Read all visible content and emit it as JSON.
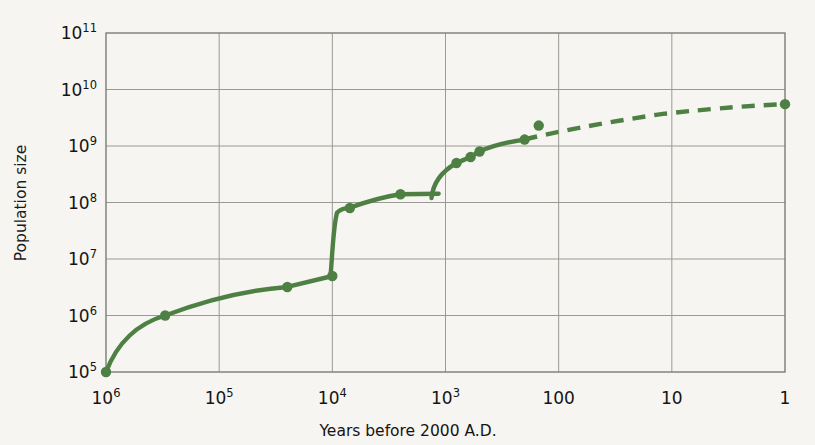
{
  "chart_data": {
    "type": "line",
    "title": "",
    "xlabel": "Years before 2000 A.D.",
    "ylabel": "Population size",
    "x_scale": "log-reversed",
    "y_scale": "log",
    "xlim": [
      1000000,
      1
    ],
    "ylim": [
      100000,
      100000000000
    ],
    "grid": true,
    "legend": null,
    "x_ticks": [
      {
        "value": 1000000,
        "label": "10",
        "exp": "6"
      },
      {
        "value": 100000,
        "label": "10",
        "exp": "5"
      },
      {
        "value": 10000,
        "label": "10",
        "exp": "4"
      },
      {
        "value": 1000,
        "label": "10",
        "exp": "3"
      },
      {
        "value": 100,
        "label": "100",
        "exp": ""
      },
      {
        "value": 10,
        "label": "10",
        "exp": ""
      },
      {
        "value": 1,
        "label": "1",
        "exp": ""
      }
    ],
    "y_ticks": [
      {
        "value": 100000000000,
        "label": "10",
        "exp": "11"
      },
      {
        "value": 10000000000,
        "label": "10",
        "exp": "10"
      },
      {
        "value": 1000000000,
        "label": "10",
        "exp": "9"
      },
      {
        "value": 100000000,
        "label": "10",
        "exp": "8"
      },
      {
        "value": 10000000,
        "label": "10",
        "exp": "7"
      },
      {
        "value": 1000000,
        "label": "10",
        "exp": "6"
      },
      {
        "value": 100000,
        "label": "10",
        "exp": "5"
      }
    ],
    "series": [
      {
        "name": "World population",
        "color": "#4e8044",
        "style": "solid-then-dashed",
        "dash_starts_at_x": 200,
        "points": [
          {
            "x": 1000000,
            "y": 100000,
            "marker": true
          },
          {
            "x": 300000,
            "y": 1000000,
            "marker": true
          },
          {
            "x": 25000,
            "y": 3200000,
            "marker": true
          },
          {
            "x": 10000,
            "y": 5000000,
            "marker": true
          },
          {
            "x": 7000,
            "y": 80000000,
            "marker": true
          },
          {
            "x": 2500,
            "y": 140000000,
            "marker": true
          },
          {
            "x": 800,
            "y": 500000000,
            "marker": true
          },
          {
            "x": 600,
            "y": 640000000,
            "marker": true
          },
          {
            "x": 500,
            "y": 800000000,
            "marker": true
          },
          {
            "x": 200,
            "y": 1300000000,
            "marker": true
          },
          {
            "x": 150,
            "y": 2300000000,
            "marker": true
          },
          {
            "x": 1,
            "y": 5500000000,
            "marker": true
          }
        ],
        "curve_notes": "Slow rise through Paleolithic, agricultural step at 10^4 years, plateau to ~10^3 years with a brief plague dip crossing, then industrial-era exponential rise, dashed after 200 years before present."
      }
    ],
    "colors": {
      "series": "#4e8044",
      "grid": "#9a9a94",
      "axis": "#6e6e68",
      "background": "#f6f5f1",
      "text": "#141414"
    }
  }
}
